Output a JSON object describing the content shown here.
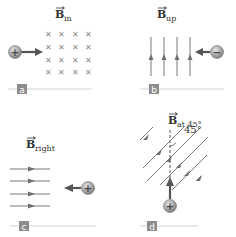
{
  "panels": [
    {
      "id": "a",
      "letter": "a",
      "field_label": "B",
      "field_sub": "in",
      "field_direction": "into-page",
      "charge_sign": "+",
      "velocity_direction": "right",
      "field_symbol": "×"
    },
    {
      "id": "b",
      "letter": "b",
      "field_label": "B",
      "field_sub": "up",
      "field_direction": "up",
      "charge_sign": "−",
      "velocity_direction": "left"
    },
    {
      "id": "c",
      "letter": "c",
      "field_label": "B",
      "field_sub": "right",
      "field_direction": "right",
      "charge_sign": "+",
      "velocity_direction": "left"
    },
    {
      "id": "d",
      "letter": "d",
      "field_label": "B",
      "field_sub": "at 45°",
      "field_direction": "45° from vertical",
      "angle_label": "45°",
      "charge_sign": "+",
      "velocity_direction": "up"
    }
  ],
  "colors": {
    "field_line": "#7a7a7a",
    "arrow": "#555555",
    "charge_fill": "#9a9a9a",
    "letter_box": "#8c8c8c",
    "rule_line": "#d4d4d4",
    "label_text": "#333333"
  }
}
